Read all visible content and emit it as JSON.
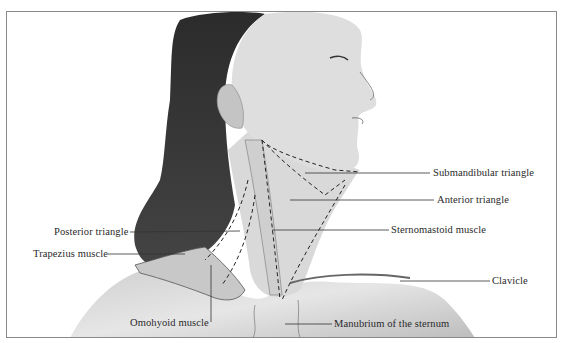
{
  "figure": {
    "labels": [
      {
        "id": "submandibular-triangle",
        "text": "Submandibular triangle",
        "x": 433,
        "y": 167,
        "line": [
          [
            305,
            173
          ],
          [
            430,
            173
          ]
        ]
      },
      {
        "id": "anterior-triangle",
        "text": "Anterior triangle",
        "x": 437,
        "y": 194,
        "line": [
          [
            290,
            200
          ],
          [
            434,
            200
          ]
        ]
      },
      {
        "id": "sternomastoid-muscle",
        "text": "Sternomastoid muscle",
        "x": 391,
        "y": 224,
        "line": [
          [
            272,
            230
          ],
          [
            389,
            230
          ]
        ]
      },
      {
        "id": "posterior-triangle",
        "text": "Posterior triangle",
        "x": 54,
        "y": 226,
        "line": [
          [
            130,
            232
          ],
          [
            240,
            231
          ]
        ]
      },
      {
        "id": "trapezius-muscle",
        "text": "Trapezius muscle",
        "x": 33,
        "y": 248,
        "line": [
          [
            108,
            254
          ],
          [
            185,
            254
          ]
        ]
      },
      {
        "id": "clavicle",
        "text": "Clavicle",
        "x": 492,
        "y": 275,
        "line": [
          [
            400,
            281
          ],
          [
            490,
            281
          ]
        ]
      },
      {
        "id": "omohyoid-muscle",
        "text": "Omohyoid muscle",
        "x": 130,
        "y": 317,
        "line": [
          [
            211,
            265
          ],
          [
            211,
            322
          ]
        ]
      },
      {
        "id": "manubrium",
        "text": "Manubrium of the sternum",
        "x": 334,
        "y": 318,
        "line": [
          [
            285,
            324
          ],
          [
            332,
            324
          ]
        ]
      }
    ]
  }
}
